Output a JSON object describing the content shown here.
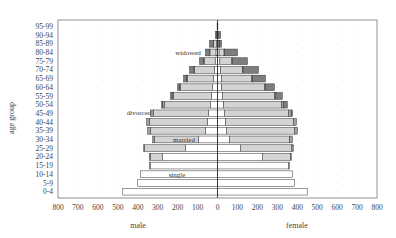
{
  "chart_data": {
    "type": "bar",
    "subtype": "population-pyramid-stacked",
    "title": "",
    "xlabel_left": "male",
    "xlabel_right": "female",
    "ylabel": "age group",
    "xlim": [
      -800,
      800
    ],
    "x_ticks_left": [
      "800",
      "700",
      "600",
      "500",
      "400",
      "300",
      "200",
      "100",
      "0"
    ],
    "x_ticks_right": [
      "0",
      "100",
      "200",
      "300",
      "400",
      "500",
      "600",
      "700",
      "800"
    ],
    "grid": "dotted",
    "categories": [
      "0-4",
      "5-9",
      "10-14",
      "15-19",
      "20-24",
      "25-29",
      "30-34",
      "35-39",
      "40-44",
      "45-49",
      "50-54",
      "55-59",
      "60-64",
      "65-69",
      "70-74",
      "75-79",
      "80-84",
      "85-89",
      "90-94",
      "95-99"
    ],
    "segments": [
      "single",
      "married",
      "divorced",
      "widowed"
    ],
    "colors": {
      "single": "#ffffff",
      "married": "#d3d3d3",
      "divorced": "#a0a0a0",
      "widowed": "#7d7d7d",
      "edge": "#333333"
    },
    "series": [
      {
        "name": "male",
        "segment": "single",
        "values": [
          475,
          400,
          385,
          338,
          275,
          160,
          95,
          60,
          50,
          45,
          35,
          30,
          25,
          20,
          15,
          12,
          8,
          5,
          2,
          0
        ]
      },
      {
        "name": "male",
        "segment": "married",
        "values": [
          0,
          0,
          0,
          2,
          63,
          205,
          220,
          275,
          290,
          275,
          230,
          190,
          160,
          130,
          100,
          55,
          30,
          15,
          3,
          1
        ]
      },
      {
        "name": "male",
        "segment": "divorced",
        "values": [
          0,
          0,
          0,
          0,
          2,
          5,
          10,
          15,
          15,
          15,
          10,
          8,
          5,
          5,
          3,
          2,
          2,
          1,
          0,
          0
        ]
      },
      {
        "name": "male",
        "segment": "widowed",
        "values": [
          0,
          0,
          0,
          0,
          0,
          0,
          0,
          0,
          0,
          0,
          5,
          7,
          10,
          15,
          22,
          21,
          20,
          19,
          5,
          1
        ]
      },
      {
        "name": "female",
        "segment": "single",
        "values": [
          450,
          385,
          375,
          355,
          225,
          115,
          60,
          45,
          40,
          35,
          30,
          25,
          20,
          20,
          15,
          12,
          8,
          5,
          2,
          0
        ]
      },
      {
        "name": "female",
        "segment": "married",
        "values": [
          0,
          0,
          0,
          5,
          140,
          258,
          300,
          340,
          340,
          320,
          290,
          260,
          215,
          150,
          110,
          60,
          25,
          5,
          2,
          0
        ]
      },
      {
        "name": "female",
        "segment": "divorced",
        "values": [
          0,
          0,
          0,
          0,
          5,
          7,
          15,
          15,
          15,
          15,
          10,
          8,
          5,
          5,
          3,
          2,
          2,
          1,
          0,
          0
        ]
      },
      {
        "name": "female",
        "segment": "widowed",
        "values": [
          0,
          0,
          0,
          0,
          0,
          0,
          0,
          0,
          0,
          5,
          20,
          32,
          45,
          65,
          77,
          76,
          65,
          9,
          11,
          2
        ]
      }
    ],
    "annotations": [
      {
        "text": "widowed",
        "side": "male",
        "row": "80-84"
      },
      {
        "text": "divorced",
        "side": "male",
        "row": "45-49"
      },
      {
        "text": "married",
        "side": "male",
        "row": "30-34"
      },
      {
        "text": "single",
        "side": "male",
        "row": "10-14"
      }
    ]
  }
}
